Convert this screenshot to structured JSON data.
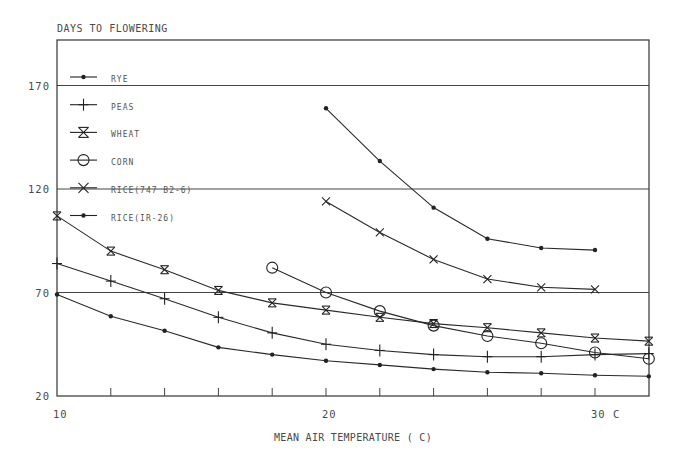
{
  "chart_data": {
    "type": "line",
    "title": "DAYS TO FLOWERING",
    "xlabel": "MEAN AIR TEMPERATURE ( C)",
    "ylabel": "DAYS TO FLOWERING",
    "xlim": [
      10,
      32
    ],
    "ylim": [
      20,
      190
    ],
    "x_tick_labels": [
      {
        "value": 10,
        "label": "10"
      },
      {
        "value": 20,
        "label": "20"
      },
      {
        "value": 30,
        "label": "30 C"
      }
    ],
    "x_minor_ticks": [
      12,
      14,
      16,
      18,
      22,
      24,
      26,
      28
    ],
    "y_tick_labels": [
      {
        "value": 20,
        "label": "20"
      },
      {
        "value": 70,
        "label": "70"
      },
      {
        "value": 120,
        "label": "120"
      },
      {
        "value": 170,
        "label": "170"
      }
    ],
    "gridlines_y": [
      70,
      120,
      170
    ],
    "grid": true,
    "legend_position": "upper-left inside",
    "series": [
      {
        "name": "RYE",
        "marker": "dot",
        "x": [
          10,
          12,
          14,
          16,
          18,
          20,
          22,
          24,
          26,
          28,
          30,
          32
        ],
        "values": [
          69,
          58.5,
          51.5,
          43.5,
          40,
          37,
          35,
          33,
          31.5,
          31,
          30,
          29.5
        ]
      },
      {
        "name": "PEAS",
        "marker": "plus",
        "x": [
          10,
          12,
          14,
          16,
          18,
          20,
          22,
          24,
          26,
          28,
          30,
          32
        ],
        "values": [
          84,
          75.5,
          67,
          58,
          50.5,
          45,
          42,
          40,
          39,
          39,
          40,
          40.5
        ]
      },
      {
        "name": "WHEAT",
        "marker": "asterisk",
        "x": [
          10,
          12,
          14,
          16,
          18,
          20,
          22,
          24,
          26,
          28,
          30,
          32
        ],
        "values": [
          107,
          90,
          81,
          71,
          65,
          61.5,
          58,
          55,
          53,
          50.5,
          48,
          46.5
        ]
      },
      {
        "name": "CORN",
        "marker": "circle",
        "x": [
          18,
          20,
          22,
          24,
          26,
          28,
          30,
          32
        ],
        "values": [
          82,
          70,
          61,
          54,
          49,
          45.5,
          41,
          38
        ]
      },
      {
        "name": "RICE(747 B2-6)",
        "marker": "x",
        "x": [
          20,
          22,
          24,
          26,
          28,
          30
        ],
        "values": [
          114,
          99,
          86,
          76.5,
          72.5,
          71.5
        ]
      },
      {
        "name": "RICE(IR-26)",
        "marker": "dot",
        "x": [
          20,
          22,
          24,
          26,
          28,
          30
        ],
        "values": [
          159,
          133.5,
          111,
          96,
          91.5,
          90.5
        ]
      }
    ]
  },
  "layout": {
    "frame": {
      "left": 57,
      "right": 649,
      "top": 40,
      "bottom": 396
    },
    "x_px_per_unit": 26.9,
    "y_px_per_unit": 2.07
  },
  "colors": {
    "line": "#2a2a2a",
    "text": "#4a4a4a",
    "background": "#ffffff"
  }
}
